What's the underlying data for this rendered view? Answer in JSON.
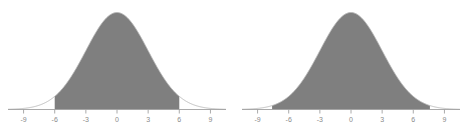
{
  "figure": {
    "background_color": "#ffffff",
    "panel_count": 2
  },
  "chart_data": [
    {
      "type": "area",
      "title": "",
      "subtitle": "",
      "xlabel": "",
      "ylabel": "",
      "curve": "normal-distribution",
      "mean": 0,
      "std_dev": 3,
      "xlim": [
        -10.5,
        10.5
      ],
      "ylim": [
        0,
        1
      ],
      "xticks": [
        -9,
        -6,
        -3,
        0,
        3,
        6,
        9
      ],
      "xticklabels": [
        "-9",
        "-6",
        "-3",
        "0",
        "3",
        "6",
        "9"
      ],
      "yticks": [],
      "yticklabels": [],
      "grid": false,
      "legend": false,
      "legend_position": "none",
      "shaded_region": {
        "from": -6,
        "to": 6,
        "fill_color": "#7f7f7f"
      },
      "curve_line_color": "#b8b8b8",
      "axis_line_color": "#a0a0a0",
      "tick_label_color": "#8a8a8a",
      "annotations": []
    },
    {
      "type": "area",
      "title": "",
      "subtitle": "",
      "xlabel": "",
      "ylabel": "",
      "curve": "normal-distribution",
      "mean": 0,
      "std_dev": 3,
      "xlim": [
        -10.5,
        10.5
      ],
      "ylim": [
        0,
        1
      ],
      "xticks": [
        -9,
        -6,
        -3,
        0,
        3,
        6,
        9
      ],
      "xticklabels": [
        "-9",
        "-6",
        "-3",
        "0",
        "3",
        "6",
        "9"
      ],
      "yticks": [],
      "yticklabels": [],
      "grid": false,
      "legend": false,
      "legend_position": "none",
      "shaded_region": {
        "from": -7.6,
        "to": 7.6,
        "fill_color": "#7f7f7f"
      },
      "curve_line_color": "#b8b8b8",
      "axis_line_color": "#a0a0a0",
      "tick_label_color": "#8a8a8a",
      "annotations": []
    }
  ]
}
